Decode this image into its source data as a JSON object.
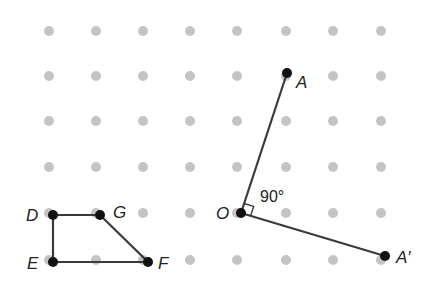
{
  "diagram": {
    "colors": {
      "grid_dot": "#c4c4c4",
      "line": "#3a3a3a",
      "point": "#111111",
      "background": "#ffffff"
    },
    "grid": {
      "columns_x": [
        49,
        96,
        143,
        190,
        237,
        286,
        333,
        381
      ],
      "rows_y": [
        31,
        76,
        121,
        167,
        213,
        260
      ]
    },
    "points": {
      "A": {
        "label": "A",
        "x": 287,
        "y": 73
      },
      "O": {
        "label": "O",
        "x": 241,
        "y": 213
      },
      "A_prime": {
        "label": "A′",
        "x": 385,
        "y": 256
      },
      "D": {
        "label": "D",
        "x": 53,
        "y": 215
      },
      "G": {
        "label": "G",
        "x": 100,
        "y": 215
      },
      "E": {
        "label": "E",
        "x": 53,
        "y": 262
      },
      "F": {
        "label": "F",
        "x": 148,
        "y": 262
      }
    },
    "angle_label": "90°"
  }
}
